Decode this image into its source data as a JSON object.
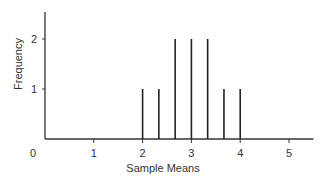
{
  "chart_data": {
    "type": "bar",
    "title": "",
    "xlabel": "Sample Means",
    "ylabel": "Frequency",
    "x": [
      2.0,
      2.333,
      2.667,
      3.0,
      3.333,
      3.667,
      4.0
    ],
    "values": [
      1,
      1,
      2,
      2,
      2,
      1,
      1
    ],
    "xticks": [
      "0",
      "1",
      "2",
      "3",
      "4",
      "5"
    ],
    "yticks": [
      "1",
      "2"
    ],
    "xlim": [
      0,
      5.5
    ],
    "ylim": [
      0,
      2.5
    ],
    "grid": false,
    "legend": null,
    "style": "spike",
    "color": "#222222"
  }
}
